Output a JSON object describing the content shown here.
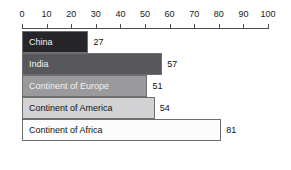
{
  "chart_data": {
    "type": "bar",
    "orientation": "horizontal",
    "title": "",
    "subtitle": "",
    "xlabel": "",
    "ylabel": "",
    "xlim": [
      0,
      100
    ],
    "grid": false,
    "legend": "none",
    "axis_position": "top",
    "tick_labels": [
      "0",
      "10",
      "20",
      "30",
      "40",
      "50",
      "60",
      "70",
      "80",
      "90",
      "100"
    ],
    "tick_values": [
      0,
      10,
      20,
      30,
      40,
      50,
      60,
      70,
      80,
      90,
      100
    ],
    "categories": [
      "China",
      "India",
      "Continent of Europe",
      "Continent of America",
      "Continent of Africa"
    ],
    "values": [
      27,
      57,
      51,
      54,
      81
    ],
    "data_labels": [
      "27",
      "57",
      "51",
      "54",
      "81"
    ],
    "bar_colors": [
      "#26262a",
      "#58585c",
      "#9a9a9c",
      "#d2d2d4",
      "#fcfcfc"
    ],
    "bar_label_colors": [
      "#f2f2f2",
      "#f2f2f2",
      "#f2f2f2",
      "#111111",
      "#111111"
    ],
    "bar_border_color": "#6e6e6e",
    "axis_color": "#4d4d4d"
  }
}
